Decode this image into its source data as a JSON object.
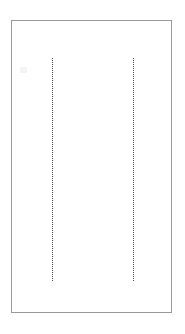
{
  "document": {
    "background_color": "#ffffff",
    "page": {
      "name": "page-sheet",
      "fill_color": "#ffffff",
      "border_color": "#9a9a9a",
      "border_width_px": 1,
      "x": 11,
      "y": 20,
      "width": 161,
      "height": 293
    },
    "guides": [
      {
        "label": "left-margin-guide",
        "orientation": "vertical",
        "style": "dotted",
        "color": "#4a4a4a",
        "x": 51,
        "y_start": 57,
        "y_end": 280
      },
      {
        "label": "right-margin-guide",
        "orientation": "vertical",
        "style": "dotted",
        "color": "#4a4a4a",
        "x": 132,
        "y_start": 57,
        "y_end": 280
      }
    ],
    "marks": [
      {
        "label": "faint-mark",
        "color": "#f4f4f6",
        "x": 19,
        "y": 66,
        "width": 7,
        "height": 6
      }
    ],
    "text_content": []
  }
}
